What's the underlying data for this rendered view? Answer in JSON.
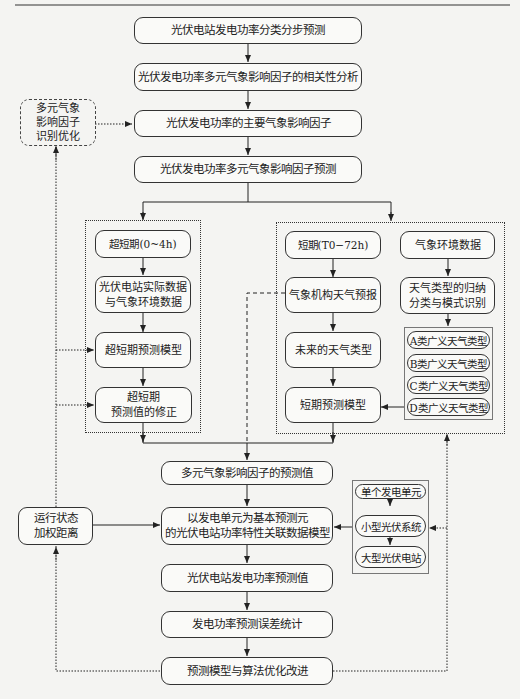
{
  "main_flow": [
    {
      "id": "n1",
      "label": "光伏电站发电功率分类分步预测"
    },
    {
      "id": "n2",
      "label": "光伏发电功率多元气象影响因子的相关性分析"
    },
    {
      "id": "n3",
      "label": "光伏发电功率的主要气象影响因子"
    },
    {
      "id": "n4",
      "label": "光伏发电功率多元气象影响因子预测"
    },
    {
      "id": "n5",
      "label": "多元气象影响因子的预测值"
    },
    {
      "id": "n6",
      "label": "以发电单元为基本预测元\n的光伏电站功率特性关联数据模型"
    },
    {
      "id": "n7",
      "label": "光伏电站发电功率预测值"
    },
    {
      "id": "n8",
      "label": "发电功率预测误差统计"
    },
    {
      "id": "n9",
      "label": "预测模型与算法优化改进"
    }
  ],
  "side_nodes": {
    "optimize": "多元气象\n影响因子\n识别优化",
    "weighted": "运行状态\n加权距离"
  },
  "ultra_short": [
    {
      "label": "超短期(0~4h)"
    },
    {
      "label": "光伏电站实际数据\n与气象环境数据"
    },
    {
      "label": "超短期预测模型"
    },
    {
      "label": "超短期\n预测值的修正"
    }
  ],
  "short_term": [
    {
      "label": "短期(T0−72h)"
    },
    {
      "label": "气象机构天气预报"
    },
    {
      "label": "未来的天气类型"
    },
    {
      "label": "短期预测模型"
    }
  ],
  "weather_classification": [
    {
      "label": "气象环境数据"
    },
    {
      "label": "天气类型的归纳\n分类与模式识别"
    }
  ],
  "weather_types": [
    "A类广义天气类型",
    "B类广义天气类型",
    "C类广义天气类型",
    "D类广义天气类型"
  ],
  "units": [
    "单个发电单元",
    "小型光伏系统",
    "大型光伏电站"
  ]
}
